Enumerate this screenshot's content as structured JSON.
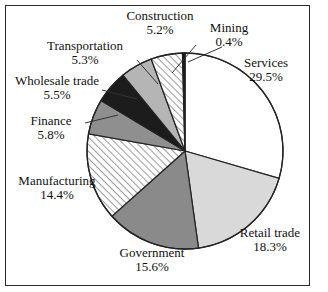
{
  "chart_data": {
    "type": "pie",
    "title": "",
    "subtitle": "",
    "xlabel": "",
    "ylabel": "",
    "legend_position": "none",
    "grid": false,
    "units": "percent",
    "start_angle_deg": 0,
    "direction": "clockwise",
    "categories": [
      "Services",
      "Retail trade",
      "Government",
      "Manufacturing",
      "Finance",
      "Wholesale trade",
      "Transportation",
      "Construction",
      "Mining"
    ],
    "values": [
      29.5,
      18.3,
      15.6,
      14.4,
      5.8,
      5.5,
      5.3,
      5.2,
      0.4
    ],
    "value_labels": [
      "29.5%",
      "18.3%",
      "15.6%",
      "14.4%",
      "5.8%",
      "5.5%",
      "5.3%",
      "5.2%",
      "0.4%"
    ],
    "slices": [
      {
        "label": "Services",
        "value": 29.5,
        "value_label": "29.5%",
        "fill": "#ffffff",
        "pattern": "solid",
        "label_x": 264,
        "label_y": 62,
        "leader": false
      },
      {
        "label": "Retail trade",
        "value": 18.3,
        "value_label": "18.3%",
        "fill": "#d9d9d9",
        "pattern": "solid",
        "label_x": 267,
        "label_y": 232,
        "leader": false
      },
      {
        "label": "Government",
        "value": 15.6,
        "value_label": "15.6%",
        "fill": "#8a8a8a",
        "pattern": "solid",
        "label_x": 150,
        "label_y": 250,
        "leader": false
      },
      {
        "label": "Manufacturing",
        "value": 14.4,
        "value_label": "14.4%",
        "fill": "#ffffff",
        "pattern": "hatch",
        "label_x": 58,
        "label_y": 179,
        "leader": false
      },
      {
        "label": "Finance",
        "value": 5.8,
        "value_label": "5.8%",
        "fill": "#8f8f8f",
        "pattern": "solid",
        "label_x": 57,
        "label_y": 120,
        "leader": true
      },
      {
        "label": "Wholesale trade",
        "value": 5.5,
        "value_label": "5.5%",
        "fill": "#1c1c1c",
        "pattern": "solid",
        "label_x": 62,
        "label_y": 79,
        "leader": true
      },
      {
        "label": "Transportation",
        "value": 5.3,
        "value_label": "5.3%",
        "fill": "#b5b5b5",
        "pattern": "solid",
        "label_x": 100,
        "label_y": 44,
        "leader": true
      },
      {
        "label": "Construction",
        "value": 5.2,
        "value_label": "5.2%",
        "fill": "#ffffff",
        "pattern": "hatch",
        "label_x": 159,
        "label_y": 13,
        "leader": true
      },
      {
        "label": "Mining",
        "value": 0.4,
        "value_label": "0.4%",
        "fill": "#111111",
        "pattern": "solid",
        "label_x": 229,
        "label_y": 26,
        "leader": true
      }
    ],
    "geometry": {
      "center_x": 185,
      "center_y": 151,
      "radius": 98
    },
    "colors": {
      "outline": "#222222",
      "text": "#111111",
      "background": "#ffffff",
      "frame": "#2b2b2b"
    }
  }
}
